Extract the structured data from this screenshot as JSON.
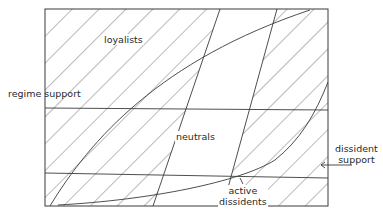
{
  "diagram": {
    "type": "conceptual population-support diagram",
    "labels": {
      "loyalists": "loyalists",
      "regime_support": "regime support",
      "neutrals": "neutrals",
      "dissident_support_line1": "dissident",
      "dissident_support_line2": "support",
      "active_dissidents_line1": "active",
      "active_dissidents_line2": "dissidents"
    },
    "regions": [
      {
        "name": "loyalists",
        "hatched": true
      },
      {
        "name": "neutrals",
        "hatched": false
      },
      {
        "name": "dissident support",
        "hatched": true
      },
      {
        "name": "active dissidents",
        "hatched": true
      }
    ],
    "colors": {
      "line": "#3a3a3a",
      "hatch": "#555555",
      "background": "#ffffff"
    }
  }
}
